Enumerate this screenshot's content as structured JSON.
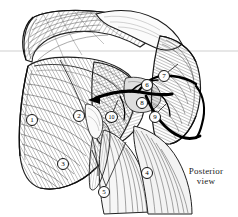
{
  "figure": {
    "type": "anatomical-illustration",
    "style": "pen-and-ink hatched line drawing, grayscale",
    "background_color": "#ffffff",
    "ink_color": "#1a1a1a",
    "caption": {
      "line1": "Posterior",
      "line2": "view"
    },
    "guide_line": {
      "color": "#cfcfcf",
      "y": 51
    },
    "callouts": [
      {
        "number": "1",
        "x": 32,
        "y": 120
      },
      {
        "number": "2",
        "x": 79,
        "y": 116
      },
      {
        "number": "3",
        "x": 63,
        "y": 164
      },
      {
        "number": "4",
        "x": 147,
        "y": 173
      },
      {
        "number": "5",
        "x": 104,
        "y": 192
      },
      {
        "number": "6",
        "x": 147,
        "y": 85
      },
      {
        "number": "7",
        "x": 164,
        "y": 76
      },
      {
        "number": "8",
        "x": 142,
        "y": 103
      },
      {
        "number": "9",
        "x": 155,
        "y": 117
      },
      {
        "number": "10",
        "x": 111,
        "y": 117
      }
    ]
  }
}
